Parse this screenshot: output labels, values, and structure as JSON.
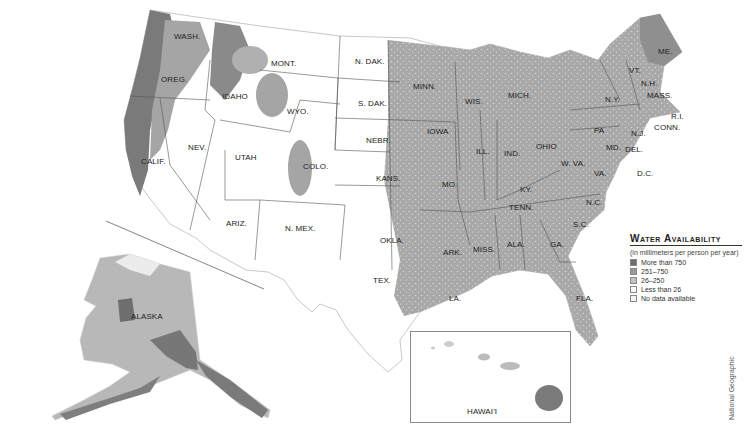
{
  "map": {
    "title": "Water Availability",
    "states": [
      {
        "name": "WASH.",
        "x": 174,
        "y": 33
      },
      {
        "name": "OREG.",
        "x": 161,
        "y": 76
      },
      {
        "name": "CALIF.",
        "x": 141,
        "y": 158
      },
      {
        "name": "NEV.",
        "x": 188,
        "y": 144
      },
      {
        "name": "IDAHO",
        "x": 222,
        "y": 93
      },
      {
        "name": "MONT.",
        "x": 271,
        "y": 60
      },
      {
        "name": "WYO.",
        "x": 287,
        "y": 108
      },
      {
        "name": "UTAH",
        "x": 235,
        "y": 154
      },
      {
        "name": "COLO.",
        "x": 303,
        "y": 163
      },
      {
        "name": "ARIZ.",
        "x": 226,
        "y": 220
      },
      {
        "name": "N. MEX.",
        "x": 285,
        "y": 225
      },
      {
        "name": "N. DAK.",
        "x": 355,
        "y": 58
      },
      {
        "name": "S. DAK.",
        "x": 358,
        "y": 100
      },
      {
        "name": "NEBR.",
        "x": 366,
        "y": 137
      },
      {
        "name": "KANS.",
        "x": 376,
        "y": 175
      },
      {
        "name": "OKLA.",
        "x": 380,
        "y": 237
      },
      {
        "name": "TEX.",
        "x": 373,
        "y": 277
      },
      {
        "name": "MINN.",
        "x": 413,
        "y": 83
      },
      {
        "name": "IOWA",
        "x": 427,
        "y": 128
      },
      {
        "name": "MO.",
        "x": 442,
        "y": 181
      },
      {
        "name": "ARK.",
        "x": 443,
        "y": 249
      },
      {
        "name": "LA.",
        "x": 449,
        "y": 295
      },
      {
        "name": "WIS.",
        "x": 465,
        "y": 98
      },
      {
        "name": "ILL.",
        "x": 476,
        "y": 148
      },
      {
        "name": "MICH.",
        "x": 508,
        "y": 92
      },
      {
        "name": "IND.",
        "x": 504,
        "y": 150
      },
      {
        "name": "OHIO",
        "x": 536,
        "y": 143
      },
      {
        "name": "KY.",
        "x": 520,
        "y": 186
      },
      {
        "name": "TENN.",
        "x": 509,
        "y": 204
      },
      {
        "name": "MISS.",
        "x": 473,
        "y": 246
      },
      {
        "name": "ALA.",
        "x": 507,
        "y": 241
      },
      {
        "name": "GA.",
        "x": 550,
        "y": 241
      },
      {
        "name": "FLA.",
        "x": 576,
        "y": 295
      },
      {
        "name": "S.C.",
        "x": 573,
        "y": 221
      },
      {
        "name": "N.C.",
        "x": 586,
        "y": 199
      },
      {
        "name": "VA.",
        "x": 594,
        "y": 170
      },
      {
        "name": "W. VA.",
        "x": 561,
        "y": 160
      },
      {
        "name": "PA",
        "x": 594,
        "y": 127
      },
      {
        "name": "N.Y.",
        "x": 605,
        "y": 96
      },
      {
        "name": "MD.",
        "x": 606,
        "y": 144
      },
      {
        "name": "DEL.",
        "x": 625,
        "y": 146
      },
      {
        "name": "D.C.",
        "x": 637,
        "y": 170
      },
      {
        "name": "N.J.",
        "x": 631,
        "y": 130
      },
      {
        "name": "VT.",
        "x": 629,
        "y": 67
      },
      {
        "name": "N.H.",
        "x": 641,
        "y": 80
      },
      {
        "name": "MASS.",
        "x": 647,
        "y": 92
      },
      {
        "name": "CONN.",
        "x": 654,
        "y": 124
      },
      {
        "name": "R.I.",
        "x": 671,
        "y": 113
      },
      {
        "name": "ME.",
        "x": 658,
        "y": 48
      },
      {
        "name": "ALASKA",
        "x": 131,
        "y": 313
      },
      {
        "name": "HAWAI'I",
        "x": 467,
        "y": 408
      }
    ]
  },
  "legend": {
    "title": "Water Availability",
    "subtitle": "(in millimeters per person per year)",
    "items": [
      {
        "label": "More than 750",
        "color": "#6e6e6e"
      },
      {
        "label": "251–750",
        "color": "#999999"
      },
      {
        "label": "26–250",
        "color": "#c4c4c4"
      },
      {
        "label": "Less than 26",
        "color": "#ffffff"
      },
      {
        "label": "No data available",
        "color": "#f2f2f2"
      }
    ]
  },
  "credit": "National Geographic"
}
